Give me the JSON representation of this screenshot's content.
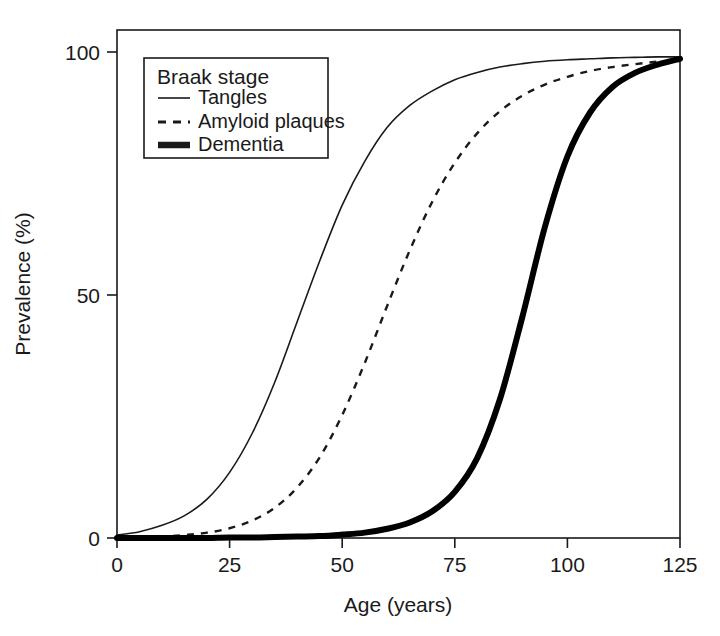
{
  "chart_data": {
    "type": "line",
    "title": "",
    "xlabel": "Age (years)",
    "ylabel": "Prevalence (%)",
    "xlim": [
      0,
      125
    ],
    "ylim": [
      0,
      100
    ],
    "xticks": [
      0,
      25,
      50,
      75,
      100,
      125
    ],
    "yticks": [
      0,
      50,
      100
    ],
    "xtick_labels": [
      "0",
      "25",
      "50",
      "75",
      "100",
      "125"
    ],
    "ytick_labels": [
      "0",
      "50",
      "100"
    ],
    "grid": false,
    "legend_position": "top-left",
    "legend_title": "Braak stage",
    "series": [
      {
        "name": "Tangles",
        "style": "solid",
        "linewidth": 1.6,
        "color": "#1a1a1a",
        "midpoint_age": 44.5,
        "max_prevalence": 99,
        "x": [
          0,
          5,
          10,
          15,
          20,
          25,
          30,
          35,
          40,
          45,
          50,
          55,
          60,
          65,
          70,
          75,
          80,
          85,
          90,
          95,
          100,
          105,
          110,
          115,
          120,
          125
        ],
        "y": [
          0.6,
          1.3,
          2.6,
          4.6,
          8.0,
          13.5,
          21.5,
          32.0,
          44.5,
          57.0,
          68.5,
          77.5,
          84.5,
          89.0,
          92.0,
          94.3,
          95.8,
          96.9,
          97.6,
          98.1,
          98.4,
          98.6,
          98.8,
          98.9,
          99.0,
          99.0
        ]
      },
      {
        "name": "Amyloid plaques",
        "style": "dashed",
        "linewidth": 2.4,
        "color": "#1a1a1a",
        "midpoint_age": 74.5,
        "max_prevalence": 99,
        "x": [
          0,
          5,
          10,
          15,
          20,
          25,
          30,
          35,
          40,
          45,
          50,
          55,
          60,
          65,
          70,
          75,
          80,
          85,
          90,
          95,
          100,
          105,
          110,
          115,
          120,
          125
        ],
        "y": [
          0.1,
          0.2,
          0.3,
          0.6,
          1.1,
          2.0,
          3.6,
          6.2,
          10.4,
          16.6,
          25.3,
          36.0,
          47.8,
          59.2,
          69.2,
          77.2,
          83.3,
          87.8,
          91.0,
          93.3,
          94.9,
          96.1,
          96.9,
          97.5,
          98.0,
          98.3
        ]
      },
      {
        "name": "Dementia",
        "style": "thick-solid",
        "linewidth": 6.0,
        "color": "#000000",
        "midpoint_age": 95.5,
        "max_prevalence": 99,
        "x": [
          0,
          5,
          10,
          15,
          20,
          25,
          30,
          35,
          40,
          45,
          50,
          55,
          60,
          65,
          70,
          75,
          80,
          85,
          90,
          95,
          100,
          105,
          110,
          115,
          120,
          125
        ],
        "y": [
          0.0,
          0.0,
          0.0,
          0.0,
          0.0,
          0.1,
          0.1,
          0.2,
          0.3,
          0.4,
          0.7,
          1.1,
          1.9,
          3.2,
          5.5,
          9.5,
          16.5,
          28.5,
          45.5,
          64.0,
          78.5,
          87.5,
          92.8,
          95.7,
          97.4,
          98.6
        ]
      }
    ]
  },
  "legend": {
    "title": "Braak stage",
    "entries": [
      {
        "label": "Tangles",
        "style": "solid"
      },
      {
        "label": "Amyloid plaques",
        "style": "dashed"
      },
      {
        "label": "Dementia",
        "style": "thick-solid"
      }
    ]
  },
  "axes": {
    "x_title": "Age (years)",
    "y_title": "Prevalence (%)"
  }
}
